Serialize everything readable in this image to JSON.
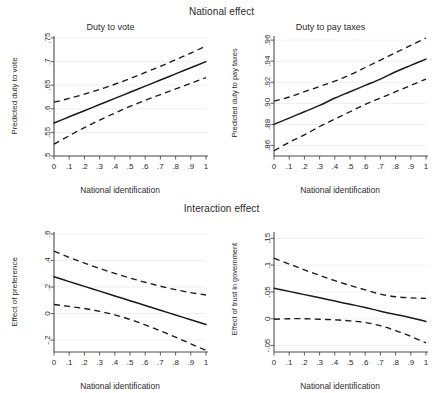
{
  "figure": {
    "supertitles": [
      {
        "text": "National effect"
      },
      {
        "text": "Interaction effect"
      }
    ]
  },
  "chart_data": [
    {
      "type": "line",
      "panel": "top-left",
      "title": "Duty to vote",
      "xlabel": "National identification",
      "ylabel": "Predicted duty to vote",
      "xlim": [
        0,
        1
      ],
      "ylim": [
        0.5,
        0.75
      ],
      "xticks": [
        "0",
        ".1",
        ".2",
        ".3",
        ".4",
        ".5",
        ".6",
        ".7",
        ".8",
        ".9",
        "1"
      ],
      "xtick_values": [
        0,
        0.1,
        0.2,
        0.3,
        0.4,
        0.5,
        0.6,
        0.7,
        0.8,
        0.9,
        1
      ],
      "yticks": [
        ".5",
        ".55",
        ".6",
        ".65",
        ".7",
        ".75"
      ],
      "ytick_values": [
        0.5,
        0.55,
        0.6,
        0.65,
        0.7,
        0.75
      ],
      "grid": "horizontal",
      "legend": "none",
      "x": [
        0,
        0.1,
        0.2,
        0.3,
        0.4,
        0.5,
        0.6,
        0.7,
        0.8,
        0.9,
        1
      ],
      "series": [
        {
          "name": "Predicted value",
          "style": "solid",
          "values": [
            0.57,
            0.583,
            0.596,
            0.609,
            0.622,
            0.635,
            0.648,
            0.661,
            0.674,
            0.687,
            0.7
          ]
        },
        {
          "name": "95% CI upper",
          "style": "dashed",
          "values": [
            0.614,
            0.622,
            0.631,
            0.641,
            0.652,
            0.664,
            0.677,
            0.69,
            0.704,
            0.718,
            0.733
          ]
        },
        {
          "name": "95% CI lower",
          "style": "dashed",
          "values": [
            0.525,
            0.543,
            0.56,
            0.576,
            0.591,
            0.605,
            0.618,
            0.63,
            0.642,
            0.654,
            0.666
          ]
        }
      ]
    },
    {
      "type": "line",
      "panel": "top-right",
      "title": "Duty to pay taxes",
      "xlabel": "National identification",
      "ylabel": "Predicted duty to pay taxes",
      "xlim": [
        0,
        1
      ],
      "ylim": [
        0.85,
        0.962
      ],
      "xticks": [
        "0",
        ".1",
        ".2",
        ".3",
        ".4",
        ".5",
        ".6",
        ".7",
        ".8",
        ".9",
        "1"
      ],
      "xtick_values": [
        0,
        0.1,
        0.2,
        0.3,
        0.4,
        0.5,
        0.6,
        0.7,
        0.8,
        0.9,
        1
      ],
      "yticks": [
        ".86",
        ".88",
        ".90",
        ".92",
        ".94",
        ".96"
      ],
      "ytick_values": [
        0.86,
        0.88,
        0.9,
        0.92,
        0.94,
        0.96
      ],
      "grid": "horizontal",
      "legend": "none",
      "x": [
        0,
        0.1,
        0.2,
        0.3,
        0.4,
        0.5,
        0.6,
        0.7,
        0.8,
        0.9,
        1
      ],
      "series": [
        {
          "name": "Predicted value",
          "style": "solid",
          "values": [
            0.88,
            0.886,
            0.892,
            0.898,
            0.905,
            0.911,
            0.917,
            0.923,
            0.93,
            0.936,
            0.942
          ]
        },
        {
          "name": "95% CI upper",
          "style": "dashed",
          "values": [
            0.902,
            0.906,
            0.911,
            0.916,
            0.921,
            0.927,
            0.934,
            0.941,
            0.948,
            0.955,
            0.962
          ]
        },
        {
          "name": "95% CI lower",
          "style": "dashed",
          "values": [
            0.855,
            0.863,
            0.87,
            0.878,
            0.885,
            0.892,
            0.899,
            0.905,
            0.911,
            0.917,
            0.923
          ]
        }
      ]
    },
    {
      "type": "line",
      "panel": "bottom-left",
      "title": "",
      "xlabel": "National identification",
      "ylabel": "Effect of preference",
      "xlim": [
        0,
        1
      ],
      "ylim": [
        -0.29,
        0.6
      ],
      "xticks": [
        "0",
        ".1",
        ".2",
        ".3",
        ".4",
        ".5",
        ".6",
        ".7",
        ".8",
        ".9",
        "1"
      ],
      "xtick_values": [
        0,
        0.1,
        0.2,
        0.3,
        0.4,
        0.5,
        0.6,
        0.7,
        0.8,
        0.9,
        1
      ],
      "yticks": [
        "-.2",
        "0",
        ".2",
        ".4",
        ".6"
      ],
      "ytick_values": [
        -0.2,
        0,
        0.2,
        0.4,
        0.6
      ],
      "grid": "horizontal",
      "legend": "none",
      "x": [
        0,
        0.1,
        0.2,
        0.3,
        0.4,
        0.5,
        0.6,
        0.7,
        0.8,
        0.9,
        1
      ],
      "series": [
        {
          "name": "Marginal effect",
          "style": "solid",
          "values": [
            0.277,
            0.241,
            0.205,
            0.169,
            0.133,
            0.097,
            0.061,
            0.025,
            -0.011,
            -0.047,
            -0.083
          ]
        },
        {
          "name": "95% CI upper",
          "style": "dashed",
          "values": [
            0.47,
            0.424,
            0.381,
            0.34,
            0.303,
            0.268,
            0.236,
            0.206,
            0.18,
            0.158,
            0.14
          ]
        },
        {
          "name": "95% CI lower",
          "style": "dashed",
          "values": [
            0.068,
            0.054,
            0.038,
            0.017,
            -0.01,
            -0.044,
            -0.085,
            -0.13,
            -0.178,
            -0.228,
            -0.278
          ]
        }
      ]
    },
    {
      "type": "line",
      "panel": "bottom-right",
      "title": "",
      "xlabel": "National identification",
      "ylabel": "Effect of trust in government",
      "xlim": [
        0,
        1
      ],
      "ylim": [
        -0.062,
        0.158
      ],
      "xticks": [
        "0",
        ".1",
        ".2",
        ".3",
        ".4",
        ".5",
        ".6",
        ".7",
        ".8",
        ".9",
        "1"
      ],
      "xtick_values": [
        0,
        0.1,
        0.2,
        0.3,
        0.4,
        0.5,
        0.6,
        0.7,
        0.8,
        0.9,
        1
      ],
      "yticks": [
        "-.05",
        "0",
        ".05",
        ".1",
        ".15"
      ],
      "ytick_values": [
        -0.05,
        0,
        0.05,
        0.1,
        0.15
      ],
      "grid": "horizontal",
      "legend": "none",
      "x": [
        0,
        0.1,
        0.2,
        0.3,
        0.4,
        0.5,
        0.6,
        0.7,
        0.8,
        0.9,
        1
      ],
      "series": [
        {
          "name": "Marginal effect",
          "style": "solid",
          "values": [
            0.057,
            0.051,
            0.045,
            0.039,
            0.033,
            0.027,
            0.021,
            0.014,
            0.008,
            0.002,
            -0.005
          ]
        },
        {
          "name": "95% CI upper",
          "style": "dashed",
          "values": [
            0.113,
            0.102,
            0.091,
            0.081,
            0.071,
            0.062,
            0.054,
            0.046,
            0.041,
            0.039,
            0.038
          ]
        },
        {
          "name": "95% CI lower",
          "style": "dashed",
          "values": [
            -0.001,
            0.0,
            0.0,
            -0.001,
            -0.002,
            -0.004,
            -0.007,
            -0.013,
            -0.022,
            -0.033,
            -0.045
          ]
        }
      ]
    }
  ]
}
